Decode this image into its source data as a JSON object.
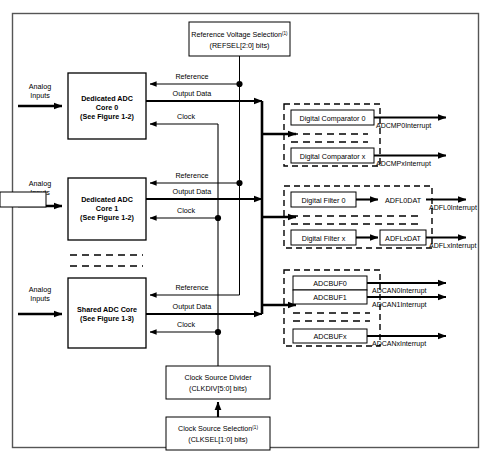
{
  "figure": {
    "outer_frame": {
      "label": "figure-border"
    },
    "background_color": "#ffffff",
    "line_color": "#000000"
  },
  "reference_block": {
    "line1": "Reference Voltage Selection",
    "superscript": "(1)",
    "line2": "(REFSEL[2:0] bits)"
  },
  "cores": [
    {
      "name": "core-0",
      "line1": "Dedicated ADC",
      "line2": "Core 0",
      "line3": "(See Figure 1-2)",
      "input_label_line1": "Analog",
      "input_label_line2": "Inputs",
      "wires": {
        "reference": "Reference",
        "output": "Output Data",
        "clock": "Clock"
      }
    },
    {
      "name": "core-1",
      "line1": "Dedicated ADC",
      "line2": "Core 1",
      "line3": "(See Figure 1-2)",
      "input_label_line1": "Analog",
      "input_label_line2": "Inputs",
      "wires": {
        "reference": "Reference",
        "output": "Output Data",
        "clock": "Clock"
      }
    },
    {
      "name": "shared-core",
      "line1": "Shared ADC Core",
      "line2": "(See Figure 1-3)",
      "line3": "",
      "input_label_line1": "Analog",
      "input_label_line2": "Inputs",
      "wires": {
        "reference": "Reference",
        "output": "Output Data",
        "clock": "Clock"
      }
    }
  ],
  "comparator_group": {
    "rows": [
      {
        "block": "Digital Comparator 0",
        "interrupt": "ADCMP0Interrupt"
      },
      {
        "block": "Digital Comparator x",
        "interrupt": "ADCMPxInterrupt"
      }
    ]
  },
  "filter_group": {
    "rows": [
      {
        "block": "Digital Filter 0",
        "data": "ADFL0DAT",
        "interrupt": "ADFL0Interrupt"
      },
      {
        "block": "Digital Filter x",
        "data": "ADFLxDAT",
        "interrupt": "ADFLxInterrupt"
      }
    ]
  },
  "buffer_group": {
    "rows": [
      {
        "block": "ADCBUF0",
        "interrupt": "ADCAN0Interrupt"
      },
      {
        "block": "ADCBUF1",
        "interrupt": "ADCAN1Interrupt"
      },
      {
        "block": "ADCBUFx",
        "interrupt": "ADCANxInterrupt"
      }
    ]
  },
  "clock_divider_block": {
    "line1": "Clock Source Divider",
    "line2": "(CLKDIV[5:0] bits)"
  },
  "clock_select_block": {
    "line1": "Clock Source Selection",
    "superscript": "(1)",
    "line2": "(CLKSEL[1:0] bits)"
  }
}
